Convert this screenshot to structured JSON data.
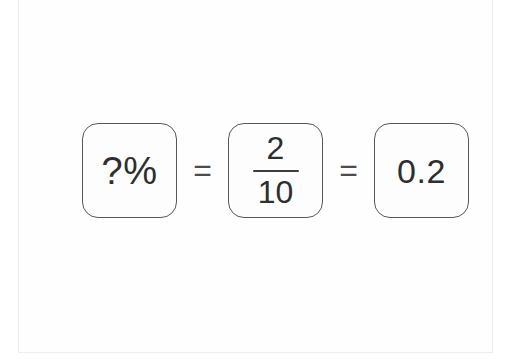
{
  "equation": {
    "percent": {
      "label": "?%"
    },
    "equals_first": "=",
    "fraction": {
      "numerator": "2",
      "denominator": "10"
    },
    "equals_second": "=",
    "decimal": {
      "label": "0.2"
    }
  },
  "colors": {
    "text": "#2e2e2e",
    "box_border": "#575757",
    "card_edge": "#ececec",
    "background": "#ffffff"
  }
}
